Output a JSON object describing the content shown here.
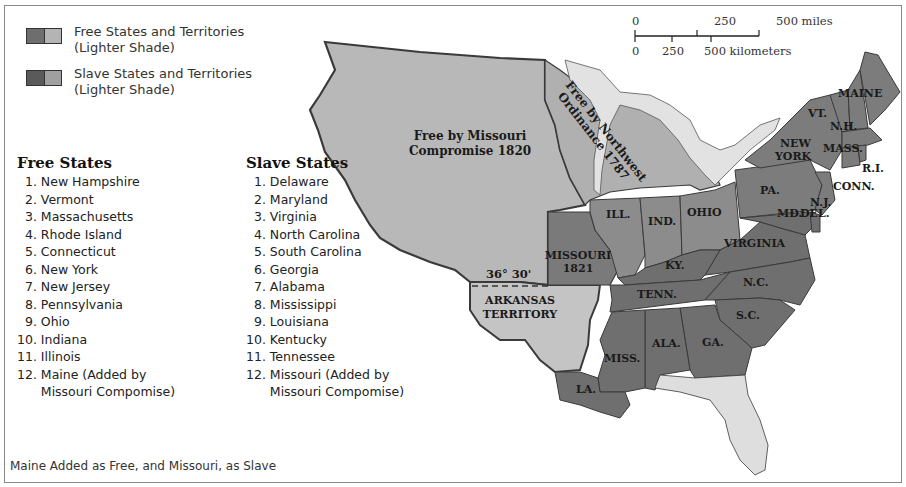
{
  "legend": {
    "items": [
      {
        "label_line1": "Free States and Territories",
        "label_line2": "(Lighter Shade)",
        "dark_color": "#6e6e6e",
        "light_color": "#b4b4b4"
      },
      {
        "label_line1": "Slave States and Territories",
        "label_line2": "(Lighter Shade)",
        "dark_color": "#5a5a5a",
        "light_color": "#a0a0a0"
      }
    ]
  },
  "scale_bar": {
    "miles": {
      "ticks": [
        "0",
        "250",
        "500 miles"
      ]
    },
    "kilometers": {
      "ticks": [
        "0",
        "250",
        "500 kilometers"
      ]
    }
  },
  "free_states": {
    "title": "Free States",
    "items": [
      "  1. New Hampshire",
      "  2. Vermont",
      "  3. Massachusetts",
      "  4. Rhode Island",
      "  5. Connecticut",
      "  6. New York",
      "  7. New Jersey",
      "  8. Pennsylvania",
      "  9. Ohio",
      "10. Indiana",
      "11. Illinois",
      "12. Maine (Added by",
      "      Missouri Compomise)"
    ]
  },
  "slave_states": {
    "title": "Slave States",
    "items": [
      "  1. Delaware",
      "  2. Maryland",
      "  3. Virginia",
      "  4. North Carolina",
      "  5. South Carolina",
      "  6. Georgia",
      "  7. Alabama",
      "  8. Mississippi",
      "  9. Louisiana",
      "10. Kentucky",
      "11. Tennessee",
      "12. Missouri (Added by",
      "      Missouri Compomise)"
    ]
  },
  "map": {
    "colors": {
      "free_territory": "#b8b8b8",
      "free_state": "#8c8c8c",
      "slave_state": "#6f6f6f",
      "slave_territory": "#c4c4c4",
      "water_light": "#e2e2e2",
      "border": "#3a3a3a"
    },
    "labels": {
      "missouri_compromise": [
        "Free by Missouri",
        "Compromise 1820"
      ],
      "northwest_ordinance": [
        "Free by Northwest",
        "Ordinance 1787"
      ],
      "latitude_line": "36° 30'",
      "arkansas": [
        "ARKANSAS",
        "TERRITORY"
      ],
      "missouri": [
        "MISSOURI",
        "1821"
      ],
      "maine": "MAINE",
      "vt": "VT.",
      "nh": "N.H.",
      "mass": "MASS.",
      "ri": "R.I.",
      "conn": "CONN.",
      "new_york": [
        "NEW",
        "YORK"
      ],
      "pa": "PA.",
      "nj": "N.J.",
      "md": "MD.",
      "del": "DEL.",
      "ohio": "OHIO",
      "ind": "IND.",
      "ill": "ILL.",
      "virginia": "VIRGINIA",
      "ky": "KY.",
      "tenn": "TENN.",
      "nc": "N.C.",
      "sc": "S.C.",
      "ga": "GA.",
      "ala": "ALA.",
      "miss": "MISS.",
      "la": "LA."
    }
  },
  "caption": "Maine Added as Free, and Missouri, as Slave"
}
